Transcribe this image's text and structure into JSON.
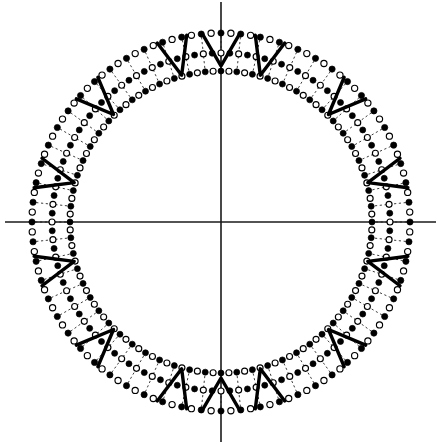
{
  "figure": {
    "title": "Polar dial diagram with three concentric dotted rings",
    "background_color": "#ffffff",
    "ink_color": "#000000",
    "width": 441,
    "height": 444
  },
  "axes": {
    "name": "crosshair-axes",
    "center": [
      221,
      222
    ],
    "color": "#1a1a1a",
    "line_width": 1.6,
    "horizontal": {
      "x1": 5,
      "y1": 222,
      "x2": 436,
      "y2": 222
    },
    "vertical": {
      "x1": 221,
      "y1": 2,
      "x2": 221,
      "y2": 442
    }
  },
  "chart_data": {
    "type": "scatter",
    "title": "Polar dial diagram with three concentric dotted rings",
    "xlabel": "",
    "ylabel": "",
    "coordinate_system": "polar",
    "center": [
      221,
      222
    ],
    "grid": false,
    "legend_position": "none",
    "marker_count_per_ring": 120,
    "angular_step_degrees": 3,
    "marker_fill_pattern": "alternating filled / hollow",
    "series": [
      {
        "name": "outer-ring",
        "radius": 189,
        "marker_radius": 3.1,
        "point_count": 120,
        "values": [
          189
        ]
      },
      {
        "name": "middle-ring",
        "radius": 169,
        "marker_radius": 3.0,
        "point_count": 120,
        "values": [
          169
        ]
      },
      {
        "name": "inner-ring",
        "radius": 151,
        "marker_radius": 3.0,
        "point_count": 120,
        "values": [
          151
        ]
      }
    ],
    "radial_connectors": {
      "name": "radial-dashed-spokes",
      "style": "dashed",
      "angular_step_degrees": 6,
      "inner_radius": 151,
      "outer_radius": 189,
      "count": 60
    },
    "annotations": {
      "name": "bold-chevron-marks",
      "shape": "V",
      "orientation": "apex points radially inward toward center",
      "count": 12,
      "angles_degrees": [
        15,
        45,
        75,
        105,
        135,
        165,
        195,
        225,
        255,
        285,
        315,
        345
      ],
      "stroke_width": 3.4,
      "arm_outer_radius": 190,
      "apex_radius": 152,
      "arm_half_spread_degrees": 4.6
    },
    "axis_markers": {
      "name": "axis-pointer-marks",
      "angles_degrees": [
        90,
        270
      ],
      "description": "chevron marks aligned with the vertical axis at top and bottom"
    }
  }
}
